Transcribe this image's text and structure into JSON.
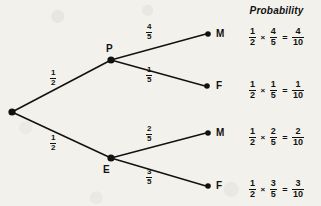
{
  "diagram": {
    "type": "probability-tree-diagram",
    "root": {
      "label": "",
      "x": 12,
      "y": 112
    },
    "nodes": [
      {
        "id": "P",
        "label": "P",
        "x": 111,
        "y": 60
      },
      {
        "id": "E",
        "label": "E",
        "x": 111,
        "y": 158
      }
    ],
    "endpoints": [
      {
        "id": "M1",
        "label": "M",
        "x": 208,
        "y": 34
      },
      {
        "id": "F1",
        "label": "F",
        "x": 207,
        "y": 86
      },
      {
        "id": "M2",
        "label": "M",
        "x": 208,
        "y": 133
      },
      {
        "id": "F2",
        "label": "F",
        "x": 208,
        "y": 186
      }
    ],
    "branches": [
      {
        "id": "root-to-P",
        "from": "root",
        "to": "P",
        "numerator": "1",
        "denominator": "2",
        "x": 52,
        "y": 70
      },
      {
        "id": "root-to-E",
        "from": "root",
        "to": "E",
        "numerator": "1",
        "denominator": "2",
        "x": 52,
        "y": 135
      },
      {
        "id": "P-to-M",
        "from": "P",
        "to": "M1",
        "numerator": "4",
        "denominator": "5",
        "x": 146,
        "y": 26
      },
      {
        "id": "P-to-F",
        "from": "P",
        "to": "F1",
        "numerator": "1",
        "denominator": "5",
        "x": 146,
        "y": 68
      },
      {
        "id": "E-to-M",
        "from": "E",
        "to": "M2",
        "numerator": "2",
        "denominator": "5",
        "x": 146,
        "y": 128
      },
      {
        "id": "E-to-F",
        "from": "E",
        "to": "F2",
        "numerator": "3",
        "denominator": "5",
        "x": 146,
        "y": 170
      }
    ]
  },
  "probability": {
    "header": "Probability",
    "multiply_symbol": "×",
    "equals_symbol": "=",
    "rows": [
      {
        "id": "row-PM",
        "y": 28,
        "first": {
          "numerator": "1",
          "denominator": "2"
        },
        "second": {
          "numerator": "4",
          "denominator": "5"
        },
        "result": {
          "numerator": "4",
          "denominator": "10"
        }
      },
      {
        "id": "row-PF",
        "y": 81,
        "first": {
          "numerator": "1",
          "denominator": "2"
        },
        "second": {
          "numerator": "1",
          "denominator": "5"
        },
        "result": {
          "numerator": "1",
          "denominator": "10"
        }
      },
      {
        "id": "row-EM",
        "y": 128,
        "first": {
          "numerator": "1",
          "denominator": "2"
        },
        "second": {
          "numerator": "2",
          "denominator": "5"
        },
        "result": {
          "numerator": "2",
          "denominator": "10"
        }
      },
      {
        "id": "row-EF",
        "y": 180,
        "first": {
          "numerator": "1",
          "denominator": "2"
        },
        "second": {
          "numerator": "3",
          "denominator": "5"
        },
        "result": {
          "numerator": "3",
          "denominator": "10"
        }
      }
    ]
  },
  "style": {
    "background": "#f2f1ec",
    "ink": "#111111",
    "line_width": 1.4,
    "node_radius": 3.4
  }
}
